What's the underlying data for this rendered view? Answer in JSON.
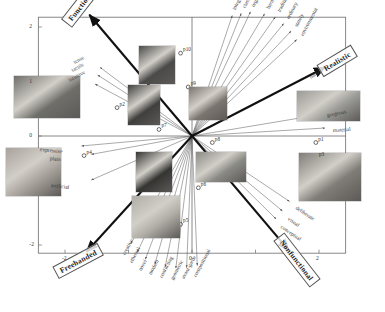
{
  "figure": {
    "title": "",
    "caption": ""
  },
  "chart_data": {
    "type": "scatter",
    "title": "",
    "subtitle": "",
    "xlabel": "",
    "ylabel": "",
    "xlim": [
      -2.6,
      2.6
    ],
    "ylim": [
      -2.4,
      2.4
    ],
    "grid": false,
    "legend": "none",
    "xticks": [
      "-2",
      "-1",
      "0",
      "1",
      "2"
    ],
    "xtick_values": [
      -2,
      -1,
      0,
      1,
      2
    ],
    "xtick_labeled": [
      "-2",
      "0",
      "2"
    ],
    "yticks": [
      "2",
      "1",
      "0",
      "-1",
      "-2"
    ],
    "ytick_values": [
      2,
      1,
      0,
      -1,
      -2
    ],
    "ytick_labeled": [
      "2",
      "1",
      "0",
      "-2"
    ],
    "points": [
      {
        "label": "p1",
        "x": 1.95,
        "y": -0.12
      },
      {
        "label": "p2",
        "x": -1.18,
        "y": 0.52
      },
      {
        "label": "p3",
        "x": 1.96,
        "y": -0.4
      },
      {
        "label": "p4",
        "x": -1.7,
        "y": -0.36
      },
      {
        "label": "p5",
        "x": -0.18,
        "y": -1.62
      },
      {
        "label": "p6",
        "x": 0.1,
        "y": -0.95
      },
      {
        "label": "p7",
        "x": -0.52,
        "y": 0.12
      },
      {
        "label": "p8",
        "x": 0.32,
        "y": -0.12
      },
      {
        "label": "p9",
        "x": -0.06,
        "y": 0.9
      },
      {
        "label": "p10",
        "x": -0.18,
        "y": 1.52
      }
    ],
    "vectors": [
      {
        "label": "integral",
        "angle_deg": 74,
        "length": 2.3,
        "group": "top"
      },
      {
        "label": "classical",
        "angle_deg": 71,
        "length": 2.38,
        "group": "top"
      },
      {
        "label": "organic",
        "angle_deg": 68,
        "length": 2.46,
        "group": "top"
      },
      {
        "label": "harmonic",
        "angle_deg": 63,
        "length": 2.52,
        "group": "top"
      },
      {
        "label": "traditional",
        "angle_deg": 59,
        "length": 2.55,
        "group": "top"
      },
      {
        "label": "ordinary",
        "angle_deg": 55,
        "length": 2.52,
        "group": "top"
      },
      {
        "label": "stately",
        "angle_deg": 51,
        "length": 2.48,
        "group": "top"
      },
      {
        "label": "environmental",
        "angle_deg": 47,
        "length": 2.42,
        "group": "top"
      },
      {
        "label": "natural",
        "angle_deg": 31,
        "length": 2.05,
        "group": "right"
      },
      {
        "label": "gorgeous",
        "angle_deg": 11,
        "length": 2.05,
        "group": "right"
      },
      {
        "label": "material",
        "angle_deg": 4,
        "length": 2.1,
        "group": "right"
      },
      {
        "label": "deliberate",
        "angle_deg": -38,
        "length": 1.95,
        "group": "lower-right"
      },
      {
        "label": "visual",
        "angle_deg": -44,
        "length": 1.98,
        "group": "lower-right"
      },
      {
        "label": "conceptual",
        "angle_deg": -49,
        "length": 2.02,
        "group": "lower-right"
      },
      {
        "label": "creative",
        "angle_deg": -116,
        "length": 2.2,
        "group": "bottom"
      },
      {
        "label": "ethereal",
        "angle_deg": -112,
        "length": 2.3,
        "group": "bottom"
      },
      {
        "label": "novel",
        "angle_deg": -108,
        "length": 2.38,
        "group": "bottom"
      },
      {
        "label": "modern",
        "angle_deg": -104,
        "length": 2.42,
        "group": "bottom"
      },
      {
        "label": "conflicting",
        "angle_deg": -100,
        "length": 2.44,
        "group": "bottom"
      },
      {
        "label": "geometric",
        "angle_deg": -96,
        "length": 2.44,
        "group": "bottom"
      },
      {
        "label": "avant-garde",
        "angle_deg": -92,
        "length": 2.42,
        "group": "bottom"
      },
      {
        "label": "compositional",
        "angle_deg": -88,
        "length": 2.38,
        "group": "bottom"
      },
      {
        "label": "expressive",
        "angle_deg": 186,
        "length": 1.75,
        "group": "left"
      },
      {
        "label": "plain",
        "angle_deg": 192,
        "length": 1.62,
        "group": "left"
      },
      {
        "label": "artificial",
        "angle_deg": 207,
        "length": 1.78,
        "group": "left"
      },
      {
        "label": "tense",
        "angle_deg": 139,
        "length": 1.92,
        "group": "upper-left"
      },
      {
        "label": "tactile",
        "angle_deg": 143,
        "length": 1.86,
        "group": "upper-left"
      },
      {
        "label": "intuitive",
        "angle_deg": 148,
        "length": 1.8,
        "group": "upper-left"
      }
    ],
    "axis_labels": [
      {
        "label": "Functional",
        "angle_deg": 126,
        "length": 2.75
      },
      {
        "label": "Realistic",
        "angle_deg": 31,
        "length": 2.45
      },
      {
        "label": "Freehanded",
        "angle_deg": -128,
        "length": 2.7
      },
      {
        "label": "Nonfunctional",
        "angle_deg": -54,
        "length": 2.6
      }
    ],
    "thumbnails": [
      {
        "name": "thumb-stools",
        "x": 14,
        "y": 76,
        "w": 66,
        "h": 42,
        "tone": "dark-gray",
        "tint": "#6f6f6a"
      },
      {
        "name": "thumb-lamp",
        "x": 139,
        "y": 46,
        "w": 36,
        "h": 38,
        "tone": "dark",
        "tint": "#4a4a48"
      },
      {
        "name": "thumb-chair-a",
        "x": 128,
        "y": 85,
        "w": 32,
        "h": 40,
        "tone": "dark",
        "tint": "#3f3f3d"
      },
      {
        "name": "thumb-lounge",
        "x": 189,
        "y": 87,
        "w": 38,
        "h": 33,
        "tone": "warm-gray",
        "tint": "#7b7570"
      },
      {
        "name": "thumb-bench",
        "x": 297,
        "y": 91,
        "w": 63,
        "h": 30,
        "tone": "light",
        "tint": "#9a9a96"
      },
      {
        "name": "thumb-sculpture",
        "x": 6,
        "y": 148,
        "w": 55,
        "h": 48,
        "tone": "light",
        "tint": "#a8a39c"
      },
      {
        "name": "thumb-dark-object",
        "x": 136,
        "y": 152,
        "w": 36,
        "h": 40,
        "tone": "very-dark",
        "tint": "#343432"
      },
      {
        "name": "thumb-desk",
        "x": 196,
        "y": 152,
        "w": 50,
        "h": 30,
        "tone": "gray",
        "tint": "#8a8a85"
      },
      {
        "name": "thumb-table-room",
        "x": 299,
        "y": 153,
        "w": 62,
        "h": 48,
        "tone": "gray",
        "tint": "#807c77"
      },
      {
        "name": "thumb-striped",
        "x": 132,
        "y": 196,
        "w": 48,
        "h": 42,
        "tone": "light-gray",
        "tint": "#b0aca6"
      }
    ],
    "arrow_color": "#555555",
    "axis_arrow_color": "#111111",
    "frame_color": "#6a6a6a"
  }
}
